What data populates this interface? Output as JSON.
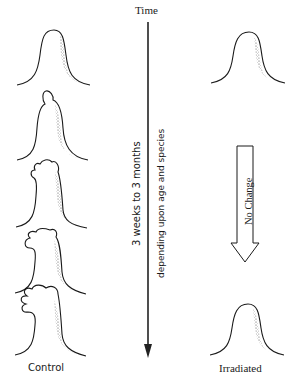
{
  "axis": {
    "label": "Time",
    "direction": "downward",
    "duration_text": "3 weeks to 3 months",
    "dependency_text": "depending upon age and species"
  },
  "columns": {
    "left": {
      "label": "Control",
      "stages": [
        {
          "stage": 1,
          "description": "smooth conical papilla"
        },
        {
          "stage": 2,
          "description": "small single bud at apex"
        },
        {
          "stage": 3,
          "description": "two-lobed outgrowth"
        },
        {
          "stage": 4,
          "description": "larger multi-lobed outgrowth"
        },
        {
          "stage": 5,
          "description": "branched digit-like outgrowth"
        }
      ]
    },
    "right": {
      "label": "Irradiated",
      "stages": [
        {
          "stage": 1,
          "description": "smooth conical papilla"
        },
        {
          "stage": 2,
          "description": "smooth conical papilla (unchanged)"
        }
      ],
      "arrow_label": "No Change"
    }
  },
  "colors": {
    "ink": "#1a1a1a",
    "stipple": "#555555",
    "background": "#ffffff"
  }
}
